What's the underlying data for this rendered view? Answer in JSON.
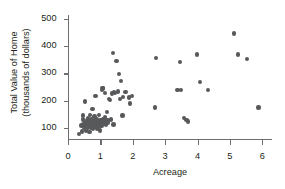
{
  "chart_data": {
    "type": "scatter",
    "title": "",
    "xlabel": "Acreage",
    "ylabel": "Total Value of Home\n(thousands of dollars)",
    "ylabel_line1": "Total Value of Home",
    "ylabel_line2": "(thousands of dollars)",
    "xlim": [
      0,
      6.3
    ],
    "ylim": [
      55,
      515
    ],
    "xticks": [
      0,
      1,
      2,
      3,
      4,
      5,
      6
    ],
    "yticks": [
      100,
      200,
      300,
      400,
      500
    ],
    "xtick_labels": [
      "0",
      "1",
      "2",
      "3",
      "4",
      "5",
      "6"
    ],
    "ytick_labels": [
      "100",
      "200",
      "300",
      "400",
      "500"
    ],
    "grid": false,
    "legend": null,
    "marker_color": "#58595b",
    "axis_color": "#6d6e71",
    "text_color": "#231f20",
    "marker_size": 4.4,
    "n_points": 86,
    "points": [
      [
        0.33,
        78
      ],
      [
        0.42,
        108
      ],
      [
        0.44,
        86
      ],
      [
        0.46,
        130
      ],
      [
        0.47,
        145
      ],
      [
        0.48,
        112
      ],
      [
        0.5,
        100
      ],
      [
        0.52,
        121
      ],
      [
        0.53,
        196
      ],
      [
        0.55,
        90
      ],
      [
        0.56,
        108
      ],
      [
        0.58,
        128
      ],
      [
        0.6,
        112
      ],
      [
        0.61,
        137
      ],
      [
        0.62,
        99
      ],
      [
        0.63,
        118
      ],
      [
        0.64,
        106
      ],
      [
        0.65,
        125
      ],
      [
        0.66,
        85
      ],
      [
        0.68,
        146
      ],
      [
        0.7,
        113
      ],
      [
        0.71,
        100
      ],
      [
        0.72,
        131
      ],
      [
        0.74,
        120
      ],
      [
        0.75,
        108
      ],
      [
        0.76,
        169
      ],
      [
        0.78,
        96
      ],
      [
        0.8,
        124
      ],
      [
        0.81,
        112
      ],
      [
        0.82,
        141
      ],
      [
        0.84,
        104
      ],
      [
        0.85,
        216
      ],
      [
        0.86,
        128
      ],
      [
        0.88,
        117
      ],
      [
        0.89,
        98
      ],
      [
        0.9,
        133
      ],
      [
        0.91,
        110
      ],
      [
        0.93,
        122
      ],
      [
        0.95,
        105
      ],
      [
        0.96,
        146
      ],
      [
        0.97,
        114
      ],
      [
        0.98,
        90
      ],
      [
        1.0,
        128
      ],
      [
        1.02,
        119
      ],
      [
        1.04,
        107
      ],
      [
        1.05,
        238
      ],
      [
        1.06,
        246
      ],
      [
        1.08,
        244
      ],
      [
        1.09,
        133
      ],
      [
        1.1,
        124
      ],
      [
        1.12,
        116
      ],
      [
        1.14,
        229
      ],
      [
        1.15,
        138
      ],
      [
        1.16,
        126
      ],
      [
        1.18,
        110
      ],
      [
        1.2,
        158
      ],
      [
        1.22,
        129
      ],
      [
        1.24,
        120
      ],
      [
        1.26,
        205
      ],
      [
        1.3,
        203
      ],
      [
        1.33,
        131
      ],
      [
        1.36,
        226
      ],
      [
        1.38,
        376
      ],
      [
        1.4,
        112
      ],
      [
        1.42,
        232
      ],
      [
        1.45,
        227
      ],
      [
        1.5,
        345
      ],
      [
        1.55,
        234
      ],
      [
        1.58,
        298
      ],
      [
        1.6,
        205
      ],
      [
        1.63,
        272
      ],
      [
        1.68,
        145
      ],
      [
        1.7,
        213
      ],
      [
        1.78,
        232
      ],
      [
        1.88,
        211
      ],
      [
        1.92,
        190
      ],
      [
        1.97,
        217
      ],
      [
        2.68,
        174
      ],
      [
        2.72,
        356
      ],
      [
        3.38,
        240
      ],
      [
        3.45,
        341
      ],
      [
        3.48,
        240
      ],
      [
        3.58,
        137
      ],
      [
        3.66,
        128
      ],
      [
        3.7,
        123
      ],
      [
        3.98,
        369
      ],
      [
        4.08,
        269
      ],
      [
        4.32,
        240
      ],
      [
        5.13,
        447
      ],
      [
        5.25,
        369
      ],
      [
        5.52,
        353
      ],
      [
        5.88,
        174
      ]
    ]
  }
}
